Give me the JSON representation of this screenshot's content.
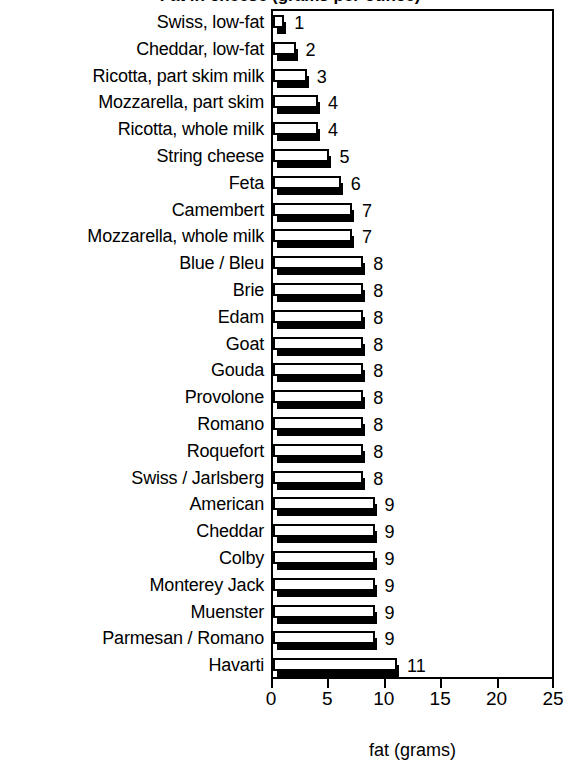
{
  "chart_data": {
    "type": "bar",
    "orientation": "horizontal",
    "title": "Fat in cheese (grams per ounce)",
    "xlabel": "fat (grams)",
    "ylabel": "",
    "xlim": [
      0,
      25
    ],
    "xticks": [
      0,
      5,
      10,
      15,
      20,
      25
    ],
    "xticklabels": [
      "0",
      "5",
      "10",
      "15",
      "20",
      "25"
    ],
    "grid": false,
    "legend": null,
    "show_value_labels": true,
    "categories": [
      "Swiss, low-fat",
      "Cheddar, low-fat",
      "Ricotta, part skim milk",
      "Mozzarella, part skim",
      "Ricotta, whole milk",
      "String cheese",
      "Feta",
      "Camembert",
      "Mozzarella, whole milk",
      "Blue / Bleu",
      "Brie",
      "Edam",
      "Goat",
      "Gouda",
      "Provolone",
      "Romano",
      "Roquefort",
      "Swiss / Jarlsberg",
      "American",
      "Cheddar",
      "Colby",
      "Monterey Jack",
      "Muenster",
      "Parmesan / Romano",
      "Havarti"
    ],
    "values": [
      1,
      2,
      3,
      4,
      4,
      5,
      6,
      7,
      7,
      8,
      8,
      8,
      8,
      8,
      8,
      8,
      8,
      8,
      9,
      9,
      9,
      9,
      9,
      9,
      11
    ],
    "value_labels": [
      "1",
      "2",
      "3",
      "4",
      "4",
      "5",
      "6",
      "7",
      "7",
      "8",
      "8",
      "8",
      "8",
      "8",
      "8",
      "8",
      "8",
      "8",
      "9",
      "9",
      "9",
      "9",
      "9",
      "9",
      "11"
    ],
    "colors": {
      "bar_face": "#ffffff",
      "bar_edge": "#000000",
      "bar_shadow": "#000000",
      "axis": "#000000",
      "text": "#000000",
      "background": "#ffffff"
    }
  }
}
